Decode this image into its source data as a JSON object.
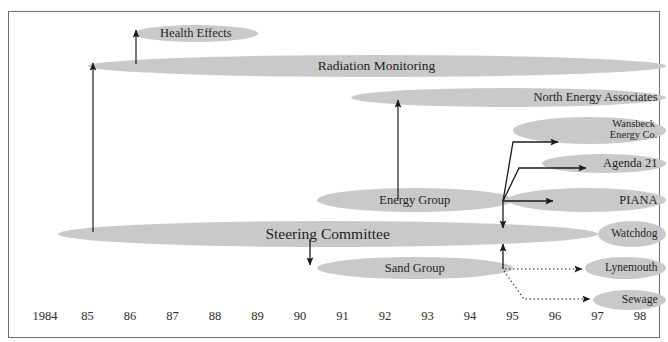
{
  "figure": {
    "clipped_caption": "",
    "frame_color": "#6f6f6f",
    "bar_color": "#c9c9c9",
    "text_color": "#1f1f1f"
  },
  "chart_data": {
    "type": "bar",
    "title": "",
    "subtitle": "",
    "xlabel": "",
    "ylabel": "",
    "orientation": "horizontal",
    "grid": false,
    "legend": "none",
    "axis": {
      "tick_labels": [
        "1984",
        "85",
        "86",
        "87",
        "88",
        "89",
        "90",
        "91",
        "92",
        "93",
        "94",
        "95",
        "96",
        "97",
        "98"
      ],
      "tick_years": [
        1984,
        1985,
        1986,
        1987,
        1988,
        1989,
        1990,
        1991,
        1992,
        1993,
        1994,
        1995,
        1996,
        1997,
        1998
      ],
      "xlim": [
        1984,
        1998.6
      ]
    },
    "categories": [
      "Health Effects",
      "Radiation  Monitoring",
      "North Energy Associates",
      "Wansbeck Energy Co.",
      "Agenda 21",
      "Energy Group",
      "PIANA",
      "Steering Committee",
      "Watchdog",
      "Sand Group",
      "Lynemouth",
      "Sewage"
    ],
    "bars": [
      {
        "label": "Health Effects",
        "label_line1": "Health Effects",
        "label_line2": "",
        "start_year": 1986.1,
        "end_year": 1989.0,
        "row": 0,
        "font_size": 12.5
      },
      {
        "label": "Radiation  Monitoring",
        "label_line1": "Radiation  Monitoring",
        "label_line2": "",
        "start_year": 1985.0,
        "end_year": 1998.6,
        "row": 1,
        "font_size": 13.5
      },
      {
        "label": "North Energy Associates",
        "label_line1": "North Energy Associates",
        "label_line2": "",
        "start_year": 1991.2,
        "end_year": 1998.6,
        "row": 2,
        "font_size": 12.5
      },
      {
        "label": "Wansbeck Energy Co.",
        "label_line1": "Wansbeck",
        "label_line2": "Energy Co.",
        "start_year": 1995.0,
        "end_year": 1998.6,
        "row": 3,
        "font_size": 10.5
      },
      {
        "label": "Agenda 21",
        "label_line1": "Agenda 21",
        "label_line2": "",
        "start_year": 1995.7,
        "end_year": 1998.6,
        "row": 4,
        "font_size": 12.5
      },
      {
        "label": "Energy Group",
        "label_line1": "Energy Group",
        "label_line2": "",
        "start_year": 1990.4,
        "end_year": 1995.0,
        "row": 5,
        "font_size": 12.5
      },
      {
        "label": "PIANA",
        "label_line1": "PIANA",
        "label_line2": "",
        "start_year": 1994.9,
        "end_year": 1998.6,
        "row": 5,
        "font_size": 12.5
      },
      {
        "label": "Steering Committee",
        "label_line1": "Steering Committee",
        "label_line2": "",
        "start_year": 1984.3,
        "end_year": 1997.0,
        "row": 6,
        "font_size": 15.5
      },
      {
        "label": "Watchdog",
        "label_line1": "Watchdog",
        "label_line2": "",
        "start_year": 1997.0,
        "end_year": 1998.6,
        "row": 6,
        "font_size": 11.5
      },
      {
        "label": "Sand Group",
        "label_line1": "Sand Group",
        "label_line2": "",
        "start_year": 1990.4,
        "end_year": 1995.0,
        "row": 7,
        "font_size": 12.5
      },
      {
        "label": "Lynemouth",
        "label_line1": "Lynemouth",
        "label_line2": "",
        "start_year": 1996.7,
        "end_year": 1998.6,
        "row": 7,
        "font_size": 11.5
      },
      {
        "label": "Sewage",
        "label_line1": "Sewage",
        "label_line2": "",
        "start_year": 1996.9,
        "end_year": 1998.6,
        "row": 8,
        "font_size": 11.5
      }
    ],
    "connectors": [
      {
        "name": "steering-to-radiation",
        "style": "solid",
        "from": "Steering Committee",
        "to": "Radiation  Monitoring"
      },
      {
        "name": "radiation-to-health",
        "style": "solid",
        "from": "Radiation  Monitoring",
        "to": "Health Effects"
      },
      {
        "name": "energy-to-north",
        "style": "solid",
        "from": "Energy Group",
        "to": "North Energy Associates"
      },
      {
        "name": "energy-to-wansbeck",
        "style": "solid",
        "from": "Energy Group",
        "to": "Wansbeck Energy Co."
      },
      {
        "name": "energy-to-agenda21",
        "style": "solid",
        "from": "Energy Group",
        "to": "Agenda 21"
      },
      {
        "name": "energy-to-piana",
        "style": "solid",
        "from": "Energy Group",
        "to": "PIANA"
      },
      {
        "name": "energy-to-steering",
        "style": "solid",
        "from": "Energy Group",
        "to": "Steering Committee"
      },
      {
        "name": "steering-to-sand",
        "style": "solid",
        "from": "Steering Committee",
        "to": "Sand Group"
      },
      {
        "name": "sand-to-steering",
        "style": "solid",
        "from": "Sand Group",
        "to": "Steering Committee"
      },
      {
        "name": "sand-to-lynemouth",
        "style": "dotted",
        "from": "Sand Group",
        "to": "Lynemouth"
      },
      {
        "name": "sand-to-sewage",
        "style": "dotted",
        "from": "Sand Group",
        "to": "Sewage"
      }
    ]
  }
}
